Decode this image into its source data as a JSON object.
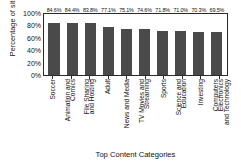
{
  "chart_data": {
    "type": "bar",
    "title": "",
    "xlabel": "Top Content Categories",
    "ylabel": "Percentage of sites",
    "ylim": [
      0,
      100
    ],
    "yticks": [
      "100%",
      "80%",
      "60%",
      "40%",
      "20%",
      "0%"
    ],
    "ytick_values": [
      100,
      80,
      60,
      40,
      20,
      0
    ],
    "grid": false,
    "legend": null,
    "bar_color": "#4a4a4a",
    "categories": [
      "Soccer",
      "Animation and Comics",
      "File Sharing and Hosting",
      "Adult",
      "News and Media",
      "TV Movies and Streaming",
      "Sports",
      "Science and Education",
      "Investing",
      "Computers Electronics and Technology"
    ],
    "category_lines": [
      [
        "Soccer"
      ],
      [
        "Animation and",
        "Comics"
      ],
      [
        "File Sharing",
        "and Hosting"
      ],
      [
        "Adult"
      ],
      [
        "News and Media"
      ],
      [
        "TV Movies and",
        "Streaming"
      ],
      [
        "Sports"
      ],
      [
        "Science and",
        "Education"
      ],
      [
        "Investing"
      ],
      [
        "Computers Electronics",
        "and Technology"
      ]
    ],
    "values": [
      84.6,
      84.4,
      83.8,
      77.1,
      75.1,
      74.6,
      71.8,
      71.0,
      70.3,
      69.5
    ],
    "value_labels": [
      "84.6%",
      "84.4%",
      "83.8%",
      "77.1%",
      "75.1%",
      "74.6%",
      "71.8%",
      "71.0%",
      "70.3%",
      "69.5%"
    ]
  }
}
